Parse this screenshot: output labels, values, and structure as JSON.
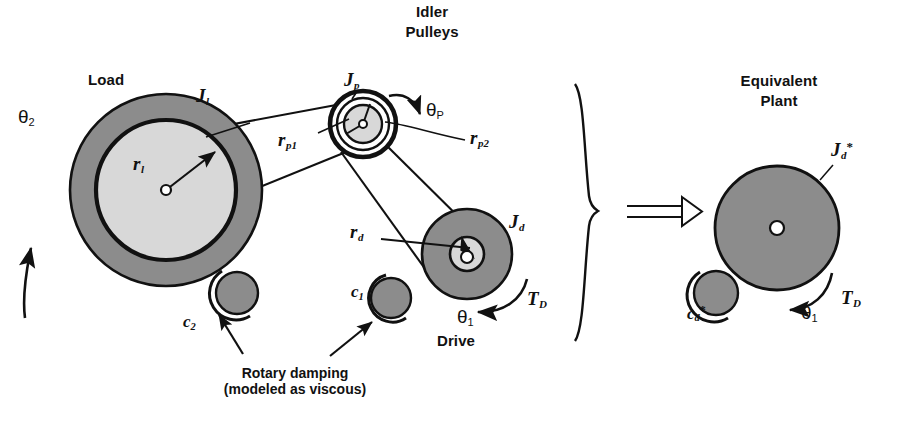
{
  "figure": {
    "background_color": "#ffffff",
    "ink_color": "#111111",
    "fill_dark_gray": "#8c8c8c",
    "fill_light_gray": "#d8d8d8",
    "fill_white": "#ffffff"
  },
  "headings": {
    "load": "Load",
    "idler_pulleys_line1": "Idler",
    "idler_pulleys_line2": "Pulleys",
    "drive": "Drive",
    "equivalent_plant_line1": "Equivalent",
    "equivalent_plant_line2": "Plant",
    "damping_line1": "Rotary damping",
    "damping_line2": "(modeled as viscous)"
  },
  "labels": {
    "theta2": {
      "base": "θ",
      "sub": "2"
    },
    "theta_p": {
      "base": "θ",
      "sub": "P"
    },
    "theta1": {
      "base": "θ",
      "sub": "1"
    },
    "J_l": {
      "base": "J",
      "sub": "l"
    },
    "J_p": {
      "base": "J",
      "sub": "p"
    },
    "J_d": {
      "base": "J",
      "sub": "d"
    },
    "J_d_star": {
      "base": "J",
      "sub": "d",
      "sup": "*"
    },
    "r_l": {
      "base": "r",
      "sub": "l"
    },
    "r_p1": {
      "base": "r",
      "sub": "p1"
    },
    "r_p2": {
      "base": "r",
      "sub": "p2"
    },
    "r_d": {
      "base": "r",
      "sub": "d"
    },
    "c_1": {
      "base": "c",
      "sub": "1"
    },
    "c_2": {
      "base": "c",
      "sub": "2"
    },
    "c_d_star": {
      "base": "c",
      "sub": "d",
      "sup": "*"
    },
    "T_D": {
      "base": "T",
      "sub": "D"
    },
    "implies_arrow": "⇒"
  },
  "geometry": {
    "load_pulley": {
      "cx": 166,
      "cy": 190,
      "r_outer": 96,
      "r_inner": 70,
      "hub_r": 5
    },
    "idler_pulley": {
      "cx": 363,
      "cy": 124,
      "r_outer": 34,
      "r_mid": 26,
      "r_inner": 19,
      "hub_r": 4
    },
    "drive_pulley": {
      "cx": 467,
      "cy": 254,
      "r_outer": 45,
      "r_inner": 17,
      "hub_r": 7
    },
    "damper_c2": {
      "cx": 237,
      "cy": 293,
      "r": 24
    },
    "damper_c1": {
      "cx": 391,
      "cy": 298,
      "r": 22
    },
    "eq_pulley": {
      "cx": 777,
      "cy": 228,
      "r": 62,
      "hub_r": 7
    },
    "eq_damper": {
      "cx": 714,
      "cy": 293,
      "r": 24
    }
  }
}
